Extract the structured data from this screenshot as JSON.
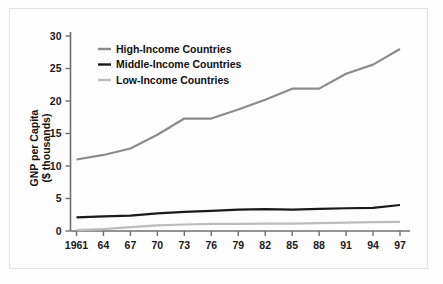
{
  "chart_data": {
    "type": "line",
    "title": "",
    "xlabel": "",
    "ylabel": "GNP per Capita\n($ thousands)",
    "ylabel_line1": "GNP per Capita",
    "ylabel_line2": "($ thousands)",
    "x": [
      1961,
      1964,
      1967,
      1970,
      1973,
      1976,
      1979,
      1982,
      1985,
      1988,
      1991,
      1994,
      1997
    ],
    "categories": [
      "1961",
      "64",
      "67",
      "70",
      "73",
      "76",
      "79",
      "82",
      "85",
      "88",
      "91",
      "94",
      "97"
    ],
    "yticks": [
      0,
      5,
      10,
      15,
      20,
      25,
      30
    ],
    "yticklabels": [
      "0",
      "5",
      "10",
      "15",
      "20",
      "25",
      "30"
    ],
    "ylim": [
      0,
      30
    ],
    "xlim": [
      1961,
      1997
    ],
    "grid": false,
    "legend_position": "upper left",
    "series": [
      {
        "name": "High-Income Countries",
        "color": "#8c8c8c",
        "width": 2.2,
        "values": [
          11.0,
          11.7,
          12.7,
          14.8,
          17.3,
          17.3,
          18.7,
          20.2,
          21.9,
          21.9,
          24.2,
          25.6,
          28.0
        ]
      },
      {
        "name": "Middle-Income Countries",
        "color": "#1a1a1a",
        "width": 2.2,
        "values": [
          2.1,
          2.25,
          2.35,
          2.7,
          2.95,
          3.1,
          3.3,
          3.35,
          3.3,
          3.4,
          3.5,
          3.55,
          4.0
        ]
      },
      {
        "name": "Low-Income Countries",
        "color": "#bcbcbc",
        "width": 2.2,
        "values": [
          0.15,
          0.3,
          0.6,
          0.85,
          1.0,
          1.1,
          1.1,
          1.12,
          1.15,
          1.2,
          1.3,
          1.35,
          1.4
        ]
      }
    ]
  },
  "legend": {
    "items": [
      {
        "label": "High-Income Countries",
        "color": "#8c8c8c"
      },
      {
        "label": "Middle-Income Countries",
        "color": "#1a1a1a"
      },
      {
        "label": "Low-Income Countries",
        "color": "#bcbcbc"
      }
    ]
  },
  "colors": {
    "background": "#fdfdfd",
    "frame": "#e3e3e3",
    "axis": "#6f6f6f",
    "text": "#111111",
    "high_income": "#8c8c8c",
    "middle_income": "#1a1a1a",
    "low_income": "#bcbcbc"
  }
}
